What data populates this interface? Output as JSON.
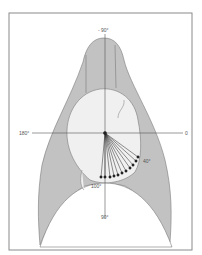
{
  "diagram": {
    "type": "anatomical angle diagram",
    "colors": {
      "frame": "#8a8a8a",
      "lung_fill": "#c2c2c2",
      "heart_fill": "#f0f0f0",
      "outline": "#7a7a7a",
      "axis": "#555555",
      "arrow": "#222222"
    },
    "labels": {
      "top": "- 90°",
      "left": "180°",
      "right": "0",
      "arrow_start": "40°",
      "arrow_end": "100°",
      "bottom": "90°"
    },
    "arrows": {
      "count": 11,
      "from_angle_deg": 40,
      "to_angle_deg": 100
    }
  }
}
